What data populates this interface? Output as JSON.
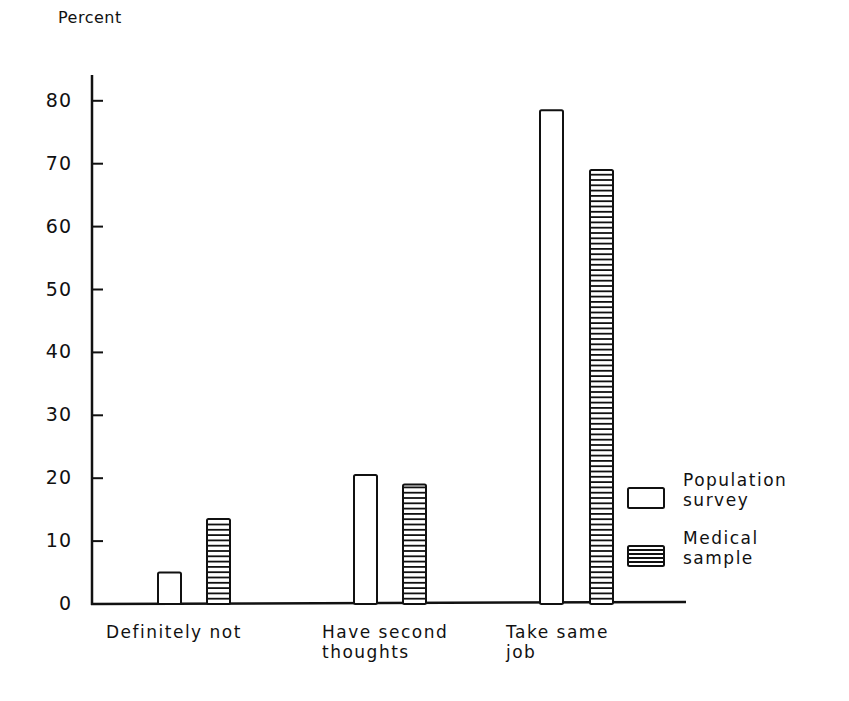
{
  "chart_data": {
    "type": "bar",
    "title": "",
    "ylabel": "Percent",
    "xlabel": "",
    "ylim": [
      0,
      80
    ],
    "yticks": [
      0,
      10,
      20,
      30,
      40,
      50,
      60,
      70,
      80
    ],
    "grid": false,
    "legend_position": "right",
    "categories": [
      "Definitely not",
      "Have second thoughts",
      "Take same job"
    ],
    "category_labels": [
      [
        "Definitely not"
      ],
      [
        "Have second",
        "thoughts"
      ],
      [
        "Take same",
        "job"
      ]
    ],
    "series": [
      {
        "name": "Population survey",
        "pattern": "open",
        "values": [
          5,
          20.5,
          78.5
        ]
      },
      {
        "name": "Medical sample",
        "pattern": "horizontal-hatch",
        "values": [
          13.5,
          19,
          69
        ]
      }
    ],
    "legend": [
      {
        "lines": [
          "Population",
          "survey"
        ]
      },
      {
        "lines": [
          "Medical",
          "sample"
        ]
      }
    ]
  },
  "colors": {
    "ink": "#111111",
    "background": "#ffffff"
  }
}
